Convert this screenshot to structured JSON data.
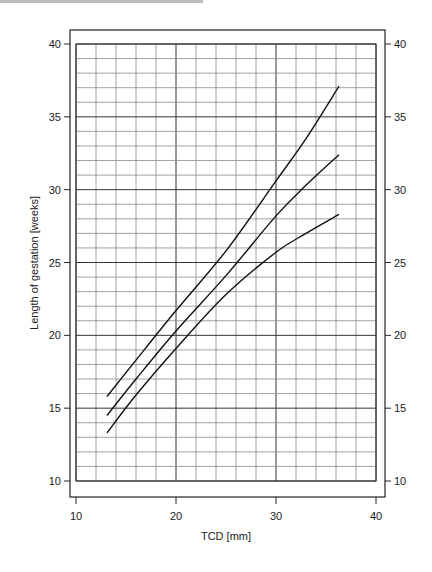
{
  "chart_data": {
    "type": "line",
    "title": "",
    "xlabel": "TCD [mm]",
    "ylabel": "Length of gestation [weeks]",
    "xlim": [
      10,
      40
    ],
    "ylim": [
      10,
      40
    ],
    "x_ticks": [
      10,
      20,
      30,
      40
    ],
    "y_ticks": [
      10,
      15,
      20,
      25,
      30,
      35,
      40
    ],
    "y_ticks_right": [
      10,
      15,
      20,
      25,
      30,
      35,
      40
    ],
    "grid": {
      "on": true,
      "x_minor_step": 2,
      "x_major_step": 10,
      "y_minor_step": 1,
      "y_major_step": 5
    },
    "legend": null,
    "x": [
      13.1,
      16,
      20,
      25,
      30,
      33,
      36.3
    ],
    "series": [
      {
        "name": "upper curve",
        "values": [
          15.8,
          18.3,
          21.7,
          25.8,
          30.6,
          33.5,
          37.1
        ]
      },
      {
        "name": "middle curve",
        "values": [
          14.5,
          17.0,
          20.3,
          24.1,
          28.2,
          30.3,
          32.4
        ]
      },
      {
        "name": "lower curve",
        "values": [
          13.3,
          15.9,
          19.1,
          22.8,
          25.7,
          27.0,
          28.3
        ]
      }
    ]
  },
  "axes": {
    "x_title": "TCD [mm]",
    "y_title": "Length of gestation [weeks]",
    "x_tick_labels": [
      "10",
      "20",
      "30",
      "40"
    ],
    "y_tick_labels": [
      "10",
      "15",
      "20",
      "25",
      "30",
      "35",
      "40"
    ]
  },
  "colors": {
    "line": "#111111",
    "grid_minor": "#8a8a8a",
    "grid_major": "#333333",
    "frame": "#222222",
    "top_bar": "#bdbdbd"
  }
}
